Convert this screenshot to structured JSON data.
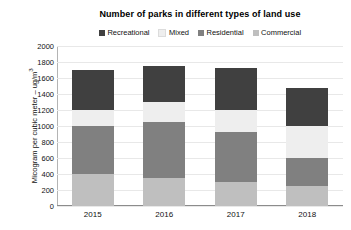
{
  "chart_data": {
    "type": "bar",
    "subtype": "stacked-vertical",
    "title": "Number of parks in different types of land use",
    "xlabel": "",
    "ylabel": "Micogram per cubic meter – ug/m3",
    "ylabel_display": "Micogram per cubic meter – ug/m",
    "ylabel_superscript": "3",
    "categories": [
      "2015",
      "2016",
      "2017",
      "2018"
    ],
    "ylim": [
      0,
      2000
    ],
    "ytick_step": 200,
    "yticks": [
      2000,
      1800,
      1600,
      1400,
      1200,
      1000,
      800,
      600,
      400,
      200,
      0
    ],
    "grid": true,
    "legend_position": "top-center",
    "stack_order_bottom_to_top": [
      "Commercial",
      "Residential",
      "Mixed",
      "Recreational"
    ],
    "series": [
      {
        "name": "Recreational",
        "color": "#404040",
        "values": [
          500,
          450,
          520,
          480
        ]
      },
      {
        "name": "Mixed",
        "color": "#eeeeee",
        "values": [
          200,
          250,
          280,
          400
        ]
      },
      {
        "name": "Residential",
        "color": "#808080",
        "values": [
          600,
          700,
          620,
          350
        ]
      },
      {
        "name": "Commercial",
        "color": "#bfbfbf",
        "values": [
          400,
          350,
          300,
          250
        ]
      }
    ],
    "totals": [
      1700,
      1750,
      1720,
      1480
    ]
  },
  "legend": {
    "items": [
      {
        "label": "Recreational",
        "color": "#404040"
      },
      {
        "label": "Mixed",
        "color": "#eeeeee"
      },
      {
        "label": "Residential",
        "color": "#808080"
      },
      {
        "label": "Commercial",
        "color": "#bfbfbf"
      }
    ]
  }
}
